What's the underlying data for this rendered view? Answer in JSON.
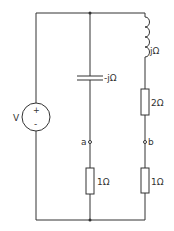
{
  "diagram": {
    "type": "circuit",
    "source": {
      "label": "V",
      "plus": "+",
      "minus": "-"
    },
    "components": {
      "capacitor": {
        "label": "-jΩ"
      },
      "inductor": {
        "label": "jΩ"
      },
      "resistor_right_top": {
        "label": "2Ω"
      },
      "resistor_middle": {
        "label": "1Ω"
      },
      "resistor_right_bottom": {
        "label": "1Ω"
      }
    },
    "nodes": {
      "a": "a",
      "b": "b"
    }
  }
}
